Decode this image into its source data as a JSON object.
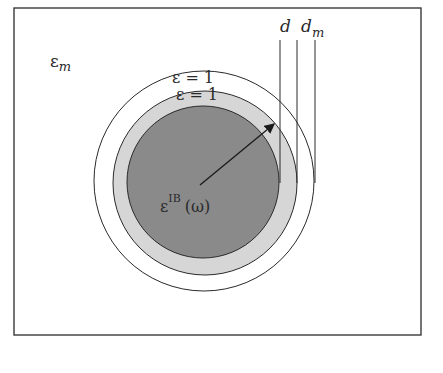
{
  "diagram": {
    "medium_label": "ε",
    "medium_sub": "m",
    "outer_shell_label": "ε = 1",
    "inner_shell_label": "ε = 1",
    "core_label": "ε",
    "core_sup": "IB",
    "core_arg": "(ω)",
    "dim_d": "d",
    "dim_dm": "d",
    "dim_dm_sub": "m",
    "colors": {
      "frame": "#3a3a3a",
      "core": "#8a8a8a",
      "shell": "#d6d6d6",
      "outer_shell": "#ffffff",
      "line": "#2a2a2a"
    }
  }
}
